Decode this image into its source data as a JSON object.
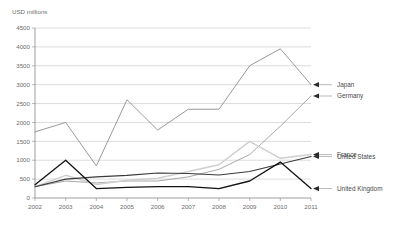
{
  "chart_data": {
    "type": "line",
    "title": "",
    "subtitle": "",
    "ylabel": "USD millions",
    "xlabel": "",
    "grid": "horizontal",
    "legend_position": "right-inline-annotations",
    "ylim": [
      0,
      4500
    ],
    "ytick_step": 500,
    "yticks": [
      "0",
      "500",
      "1000",
      "1500",
      "2000",
      "2500",
      "3000",
      "3500",
      "4000",
      "4500"
    ],
    "categories": [
      "2002",
      "2003",
      "2004",
      "2005",
      "2006",
      "2007",
      "2008",
      "2009",
      "2010",
      "2011"
    ],
    "x": [
      2002,
      2003,
      2004,
      2005,
      2006,
      2007,
      2008,
      2009,
      2010,
      2011
    ],
    "series": [
      {
        "name": "Japan",
        "color": "#8d8d8d",
        "width": 0.9,
        "values": [
          1750,
          2000,
          850,
          2600,
          1800,
          2350,
          2350,
          3500,
          3950,
          3000
        ]
      },
      {
        "name": "Germany",
        "color": "#9e9e9e",
        "width": 0.9,
        "values": [
          300,
          450,
          400,
          450,
          450,
          560,
          760,
          1150,
          1900,
          2700
        ]
      },
      {
        "name": "France",
        "color": "#cfcfcf",
        "width": 1.5,
        "values": [
          300,
          600,
          360,
          470,
          520,
          700,
          880,
          1500,
          1050,
          1150
        ]
      },
      {
        "name": "United States",
        "color": "#3a3a3a",
        "width": 1.1,
        "values": [
          300,
          500,
          560,
          600,
          660,
          650,
          610,
          700,
          900,
          1100
        ]
      },
      {
        "name": "United Kingdom",
        "color": "#111111",
        "width": 1.3,
        "values": [
          350,
          1000,
          250,
          280,
          300,
          300,
          250,
          450,
          950,
          250
        ]
      }
    ]
  },
  "annotations": [
    {
      "label": "Japan",
      "series": "Japan",
      "y_value": 3000
    },
    {
      "label": "Germany",
      "series": "Germany",
      "y_value": 2700
    },
    {
      "label": "France",
      "series": "France",
      "y_value": 1150
    },
    {
      "label": "United States",
      "series": "United States",
      "y_value": 1100
    },
    {
      "label": "United Kingdom",
      "series": "United Kingdom",
      "y_value": 250
    }
  ],
  "axis": {
    "y_unit_label": "USD millions"
  }
}
